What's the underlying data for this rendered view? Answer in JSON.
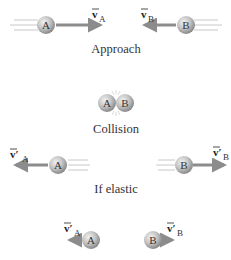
{
  "diagram": {
    "type": "collision-sequence",
    "colors": {
      "ball_light": "#e8e8e8",
      "ball_dark": "#8a8a8a",
      "arrow": "#8c8c8c",
      "motion_lines": "#c8c8c8",
      "text": "#333333"
    },
    "stages": [
      {
        "caption": "Approach",
        "ball_a": {
          "label": "A",
          "velocity_label": "v",
          "velocity_sub": "A",
          "direction": "right"
        },
        "ball_b": {
          "label": "B",
          "velocity_label": "v",
          "velocity_sub": "B",
          "direction": "left"
        }
      },
      {
        "caption": "Collision",
        "ball_a": {
          "label": "A"
        },
        "ball_b": {
          "label": "B"
        }
      },
      {
        "caption": "If elastic",
        "ball_a": {
          "label": "A",
          "velocity_label": "v′",
          "velocity_sub": "A",
          "direction": "left"
        },
        "ball_b": {
          "label": "B",
          "velocity_label": "v′",
          "velocity_sub": "B",
          "direction": "right"
        }
      },
      {
        "caption": "",
        "ball_a": {
          "label": "A",
          "velocity_label": "v′",
          "velocity_sub": "A",
          "direction": "left"
        },
        "ball_b": {
          "label": "B",
          "velocity_label": "v′",
          "velocity_sub": "B",
          "direction": "right"
        }
      }
    ]
  }
}
